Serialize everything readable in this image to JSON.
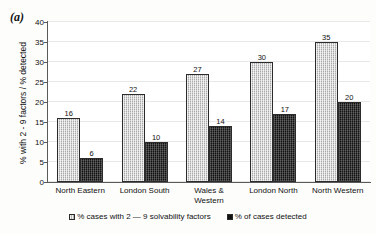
{
  "panel": {
    "label": "(a)"
  },
  "chart_data": {
    "type": "bar",
    "title": "",
    "subtitle": "",
    "xlabel": "",
    "ylabel": "% with 2 - 9 factors / % detected",
    "ylim": [
      0,
      40
    ],
    "yticks": [
      0,
      5,
      10,
      15,
      20,
      25,
      30,
      35,
      40
    ],
    "ytick_labels": [
      "0",
      "5",
      "10",
      "15",
      "20",
      "25",
      "30",
      "35",
      "40"
    ],
    "grid": true,
    "grid_axis": "y",
    "legend_position": "bottom",
    "data_labels": true,
    "categories": [
      "North Eastern",
      "London South",
      "Wales & Western",
      "London North",
      "North Western"
    ],
    "category_lines": [
      [
        "North Eastern"
      ],
      [
        "London South"
      ],
      [
        "Wales &",
        "Western"
      ],
      [
        "London North"
      ],
      [
        "North Western"
      ]
    ],
    "series": [
      {
        "name": "% cases with 2 — 9 solvability factors",
        "color": "#a9a9a9",
        "pattern": "dotted-hatch",
        "values": [
          16,
          22,
          27,
          30,
          35
        ]
      },
      {
        "name": "% of cases detected",
        "color": "#121212",
        "pattern": "solid-dark",
        "values": [
          6,
          10,
          14,
          17,
          20
        ]
      }
    ]
  }
}
